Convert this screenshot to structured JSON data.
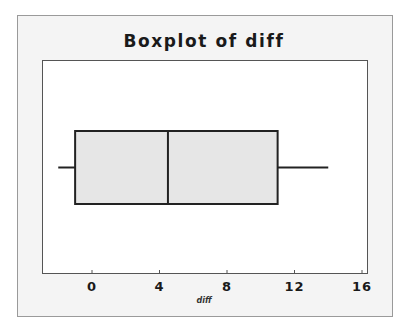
{
  "chart_data": {
    "type": "boxplot",
    "title": "Boxplot of diff",
    "xlabel": "diff",
    "ylabel": "",
    "orientation": "horizontal",
    "xlim": [
      -3,
      16.3
    ],
    "xticks": [
      0,
      4,
      8,
      12,
      16
    ],
    "xtick_labels": [
      "0",
      "4",
      "8",
      "12",
      "16"
    ],
    "grid": false,
    "series": [
      {
        "name": "diff",
        "whisker_low": -2,
        "q1": -1,
        "median": 4.5,
        "q3": 11,
        "whisker_high": 14
      }
    ],
    "box_fill": "#e6e6e6",
    "line_color": "#222222"
  },
  "title": "Boxplot of diff",
  "axis": {
    "xlabel": "diff",
    "ticks": [
      {
        "label": "0",
        "value": 0
      },
      {
        "label": "4",
        "value": 4
      },
      {
        "label": "8",
        "value": 8
      },
      {
        "label": "12",
        "value": 12
      },
      {
        "label": "16",
        "value": 16
      }
    ]
  }
}
